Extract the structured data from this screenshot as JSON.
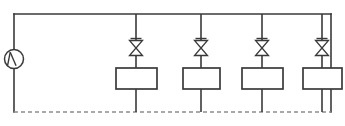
{
  "diagram": {
    "type": "piping-schematic",
    "canvas": {
      "width": 345,
      "height": 126
    },
    "colors": {
      "line": "#3a3a3a",
      "dashed_line": "#8d8d8d",
      "background": "#ffffff",
      "symbol_fill": "#ffffff"
    },
    "frame": {
      "left_x": 14,
      "right_x": 331,
      "top_y": 14,
      "bottom_y": 112
    },
    "supply_header": {
      "name": "supply-header",
      "style": "solid",
      "from_x": 14,
      "to_x": 331,
      "y": 14
    },
    "return_header": {
      "name": "return-header",
      "style": "dashed",
      "from_x": 14,
      "to_x": 331,
      "y": 112
    },
    "left_riser": {
      "name": "left-riser",
      "x": 14,
      "from_y": 14,
      "to_y": 112,
      "style": "solid"
    },
    "right_riser": {
      "name": "right-riser",
      "x": 331,
      "from_y": 14,
      "to_y": 112,
      "style": "solid"
    },
    "pump": {
      "name": "circulator-pump",
      "symbol": "pump-circle-icon",
      "cx": 14,
      "cy": 59,
      "r": 9.5
    },
    "branches": [
      {
        "id": "branch-1",
        "x": 136,
        "valve": {
          "symbol": "globe-valve-icon",
          "cy": 48,
          "half_width": 6.5,
          "half_height": 7.5,
          "cap_width": 11,
          "cap_y_offset": 9.5
        },
        "unit": {
          "symbol": "heat-emitter-box",
          "x": 116,
          "y": 68,
          "width": 41,
          "height": 21
        }
      },
      {
        "id": "branch-2",
        "x": 201,
        "valve": {
          "symbol": "globe-valve-icon",
          "cy": 48,
          "half_width": 6.5,
          "half_height": 7.5,
          "cap_width": 11,
          "cap_y_offset": 9.5
        },
        "unit": {
          "symbol": "heat-emitter-box",
          "x": 183,
          "y": 68,
          "width": 37,
          "height": 21
        }
      },
      {
        "id": "branch-3",
        "x": 262,
        "valve": {
          "symbol": "globe-valve-icon",
          "cy": 48,
          "half_width": 6.5,
          "half_height": 7.5,
          "cap_width": 11,
          "cap_y_offset": 9.5
        },
        "unit": {
          "symbol": "heat-emitter-box",
          "x": 242,
          "y": 68,
          "width": 41,
          "height": 21
        }
      },
      {
        "id": "branch-4",
        "x": 322,
        "valve": {
          "symbol": "globe-valve-icon",
          "cy": 48,
          "half_width": 6.5,
          "half_height": 7.5,
          "cap_width": 11,
          "cap_y_offset": 9.5
        },
        "unit": {
          "symbol": "heat-emitter-box",
          "x": 303,
          "y": 68,
          "width": 39,
          "height": 21
        }
      }
    ]
  }
}
